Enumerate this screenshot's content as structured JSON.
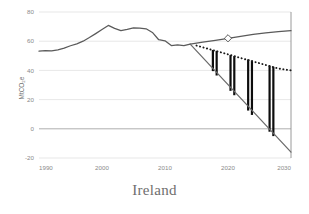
{
  "caption": "Ireland",
  "colors": {
    "historical_line": "#5a5a5a",
    "baseline_line": "#5a5a5a",
    "target_dotted": "#1a1a1a",
    "gap_bar": "#0d0d0d",
    "decline_line": "#6b6b6b",
    "gridline": "#d6d6d6",
    "zero_line": "#9a9a9a",
    "axis_text": "#8a8a8a",
    "caption_text": "#6e6e6e",
    "marker_fill": "#ffffff",
    "marker_stroke": "#4a4a4a"
  },
  "chart_data": {
    "type": "line",
    "title": "",
    "subtitle": "",
    "xlabel": "",
    "ylabel": "MtCO2e",
    "ylabel_display": "MtCO₂e",
    "xlim": [
      1990,
      2030
    ],
    "ylim": [
      -20,
      80
    ],
    "yticks": [
      -20,
      0,
      20,
      40,
      60,
      80
    ],
    "ytick_labels": [
      "-20",
      "0",
      "20",
      "40",
      "60",
      "80"
    ],
    "xticks": [
      1990,
      2000,
      2010,
      2020,
      2030
    ],
    "xtick_labels": [
      "1990",
      "2000",
      "2010",
      "2020",
      "2030"
    ],
    "grid": true,
    "grid_axis": "y",
    "legend": false,
    "legend_position": "none",
    "series": [
      {
        "name": "Historical emissions",
        "style": "solid",
        "color": "#5a5a5a",
        "x": [
          1990,
          1991,
          1992,
          1993,
          1994,
          1995,
          1996,
          1997,
          1998,
          1999,
          2000,
          2001,
          2002,
          2003,
          2004,
          2005,
          2006,
          2007,
          2008,
          2009,
          2010,
          2011,
          2012,
          2013,
          2014
        ],
        "values": [
          53.2,
          53.6,
          53.4,
          54.0,
          55.3,
          56.9,
          58.2,
          60.0,
          62.5,
          65.2,
          68.0,
          70.8,
          68.8,
          67.3,
          68.1,
          69.2,
          69.0,
          68.5,
          66.0,
          61.0,
          60.3,
          57.0,
          57.5,
          57.0,
          58.0
        ]
      },
      {
        "name": "Baseline projection with existing measures",
        "style": "solid",
        "color": "#5a5a5a",
        "x": [
          2014,
          2016,
          2018,
          2020,
          2022,
          2024,
          2026,
          2028,
          2030
        ],
        "values": [
          58.0,
          59.3,
          60.6,
          62.0,
          63.3,
          64.6,
          65.7,
          66.5,
          67.2
        ],
        "marker": {
          "at_x": 2020,
          "at_y": 62.0,
          "shape": "diamond"
        }
      },
      {
        "name": "Target pathway",
        "style": "dotted",
        "color": "#1a1a1a",
        "x": [
          2015,
          2016,
          2017,
          2018,
          2019,
          2020,
          2021,
          2022,
          2023,
          2024,
          2025,
          2026,
          2027,
          2028,
          2029,
          2030
        ],
        "values": [
          57.0,
          55.8,
          54.6,
          53.4,
          52.2,
          51.0,
          49.8,
          48.5,
          47.3,
          46.1,
          44.9,
          43.7,
          42.5,
          41.3,
          40.6,
          40.0
        ]
      },
      {
        "name": "Required reduction pathway",
        "style": "solid",
        "color": "#6b6b6b",
        "x": [
          2014,
          2030
        ],
        "values": [
          58.0,
          -16.0
        ]
      }
    ],
    "gap_bars": {
      "name": "Emissions gap",
      "color": "#0d0d0d",
      "description": "Vertical bars spanning from the target pathway down to the required reduction pathway",
      "bars": [
        {
          "x": 2017.6,
          "top": 54.0,
          "bottom": 39.5
        },
        {
          "x": 2018.2,
          "top": 53.4,
          "bottom": 36.5
        },
        {
          "x": 2020.4,
          "top": 50.5,
          "bottom": 26.0
        },
        {
          "x": 2021.0,
          "top": 49.8,
          "bottom": 23.0
        },
        {
          "x": 2023.2,
          "top": 47.5,
          "bottom": 12.5
        },
        {
          "x": 2023.8,
          "top": 46.8,
          "bottom": 9.5
        },
        {
          "x": 2026.6,
          "top": 43.2,
          "bottom": -2.0
        },
        {
          "x": 2027.2,
          "top": 42.5,
          "bottom": -5.0
        }
      ]
    }
  }
}
